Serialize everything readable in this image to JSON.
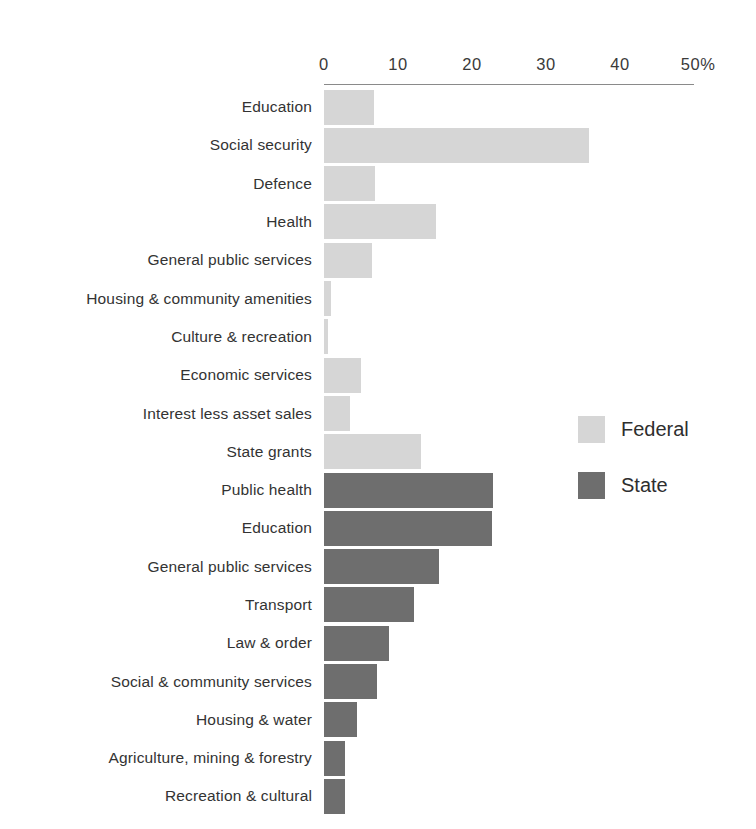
{
  "chart_data": {
    "type": "bar",
    "orientation": "horizontal",
    "title": "",
    "subtitle": "",
    "xlabel": "",
    "ylabel": "",
    "xlim": [
      0,
      50
    ],
    "grid": false,
    "axis_position": "top",
    "axis_suffix": "%",
    "tick_labels": [
      "0",
      "10",
      "20",
      "30",
      "40",
      "50%"
    ],
    "tick_values": [
      0,
      10,
      20,
      30,
      40,
      50
    ],
    "legend_position": "middle-right",
    "legend": [
      {
        "name": "Federal",
        "color": "#d6d6d6"
      },
      {
        "name": "State",
        "color": "#6e6e6e"
      }
    ],
    "groups": [
      {
        "series": "Federal",
        "color": "#d6d6d6",
        "categories": [
          "Education",
          "Social security",
          "Defence",
          "Health",
          "General public services",
          "Housing & community amenities",
          "Culture & recreation",
          "Economic services",
          "Interest less asset sales",
          "State grants"
        ],
        "values": [
          6.8,
          35.8,
          6.9,
          15.1,
          6.5,
          1.0,
          0.5,
          5.0,
          3.5,
          13.1
        ]
      },
      {
        "series": "State",
        "color": "#6e6e6e",
        "categories": [
          "Public health",
          "Education",
          "General public services",
          "Transport",
          "Law & order",
          "Social & community services",
          "Housing & water",
          "Agriculture, mining & forestry",
          "Recreation & cultural"
        ],
        "values": [
          22.9,
          22.7,
          15.6,
          12.1,
          8.8,
          7.1,
          4.4,
          2.8,
          2.8
        ]
      }
    ],
    "rows": [
      {
        "label": "Education",
        "value": 6.8,
        "series": "Federal"
      },
      {
        "label": "Social security",
        "value": 35.8,
        "series": "Federal"
      },
      {
        "label": "Defence",
        "value": 6.9,
        "series": "Federal"
      },
      {
        "label": "Health",
        "value": 15.1,
        "series": "Federal"
      },
      {
        "label": "General public services",
        "value": 6.5,
        "series": "Federal"
      },
      {
        "label": "Housing & community amenities",
        "value": 1.0,
        "series": "Federal"
      },
      {
        "label": "Culture & recreation",
        "value": 0.5,
        "series": "Federal"
      },
      {
        "label": "Economic services",
        "value": 5.0,
        "series": "Federal"
      },
      {
        "label": "Interest less asset sales",
        "value": 3.5,
        "series": "Federal"
      },
      {
        "label": "State grants",
        "value": 13.1,
        "series": "Federal"
      },
      {
        "label": "Public health",
        "value": 22.9,
        "series": "State"
      },
      {
        "label": "Education",
        "value": 22.7,
        "series": "State"
      },
      {
        "label": "General public services",
        "value": 15.6,
        "series": "State"
      },
      {
        "label": "Transport",
        "value": 12.1,
        "series": "State"
      },
      {
        "label": "Law & order",
        "value": 8.8,
        "series": "State"
      },
      {
        "label": "Social & community services",
        "value": 7.1,
        "series": "State"
      },
      {
        "label": "Housing & water",
        "value": 4.4,
        "series": "State"
      },
      {
        "label": "Agriculture, mining & forestry",
        "value": 2.8,
        "series": "State"
      },
      {
        "label": "Recreation & cultural",
        "value": 2.8,
        "series": "State"
      }
    ]
  }
}
